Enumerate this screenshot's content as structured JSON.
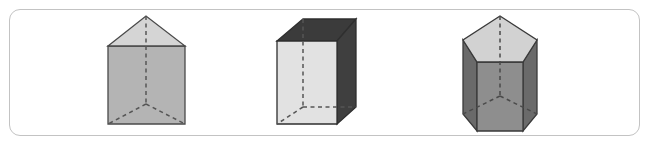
{
  "figure": {
    "caption": "",
    "frame": {
      "border_color": "#c3c3c3",
      "background_color": "#ffffff",
      "corner_radius": 11
    },
    "solids": [
      {
        "id": "triangular-prism",
        "name": "triangular prism",
        "position": "left",
        "faces": {
          "top_face_color": "#d5d5d5",
          "front_face_color": "#b4b4b4",
          "edge_color": "#4a4a4a",
          "hidden_edge_color": "#555555"
        },
        "geometry": {
          "apex": [
            146,
            16
          ],
          "top_left": [
            108,
            46
          ],
          "top_right": [
            185,
            46
          ],
          "bottom_left": [
            108,
            124
          ],
          "bottom_right": [
            185,
            124
          ],
          "hidden_back_vertex": [
            146,
            104
          ],
          "vertical_dashed_from": [
            146,
            16
          ],
          "vertical_dashed_to": [
            146,
            104
          ]
        }
      },
      {
        "id": "rectangular-prism",
        "name": "rectangular prism",
        "position": "center",
        "faces": {
          "top_face_color": "#3b3b3b",
          "front_face_color": "#e2e2e2",
          "right_face_color": "#3f3f3f",
          "edge_color": "#2f2f2f",
          "hidden_edge_color": "#555555"
        },
        "geometry": {
          "front_top_left": [
            277,
            41
          ],
          "front_top_right": [
            337,
            41
          ],
          "front_bottom_right": [
            337,
            124
          ],
          "front_bottom_left": [
            277,
            124
          ],
          "back_top_left": [
            303,
            19
          ],
          "back_top_right": [
            356,
            19
          ],
          "back_bottom_right": [
            356,
            107
          ],
          "hidden_vertex": [
            303,
            107
          ],
          "vertical_dashed_from": [
            303,
            19
          ],
          "vertical_dashed_to": [
            303,
            107
          ]
        }
      },
      {
        "id": "pentagonal-prism",
        "name": "pentagonal prism",
        "position": "right",
        "faces": {
          "top_face_color": "#d2d2d2",
          "front_face_color": "#8e8e8e",
          "side_face_color": "#6a6a6a",
          "edge_color": "#3a3a3a",
          "hidden_edge_color": "#4a4a4a"
        },
        "geometry": {
          "top_apex": [
            500,
            16
          ],
          "top_left_upper": [
            463,
            40
          ],
          "top_right_upper": [
            537,
            40
          ],
          "top_left_lower": [
            477,
            62
          ],
          "top_right_lower": [
            523,
            62
          ],
          "bottom_apex": [
            500,
            96
          ],
          "bottom_left_upper": [
            463,
            114
          ],
          "bottom_right_upper": [
            537,
            114
          ],
          "bottom_left_lower": [
            477,
            131
          ],
          "bottom_right_lower": [
            523,
            131
          ],
          "vertical_dashed_from": [
            500,
            16
          ],
          "vertical_dashed_to": [
            500,
            96
          ]
        }
      }
    ]
  }
}
